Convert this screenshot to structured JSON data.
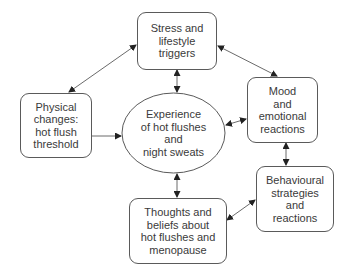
{
  "diagram": {
    "type": "cycle-model",
    "colors": {
      "stroke": "#5a5a5a",
      "text": "#3a3a3a",
      "background": "#ffffff",
      "arrow": "#222222"
    },
    "center": {
      "id": "experience",
      "label": "Experience\nof hot flushes\nand\nnight sweats",
      "shape": "ellipse"
    },
    "nodes": [
      {
        "id": "stress",
        "label": "Stress and\nlifestyle\ntriggers",
        "shape": "rounded-rect"
      },
      {
        "id": "physical",
        "label": "Physical\nchanges:\nhot flush\nthreshold",
        "shape": "rounded-rect"
      },
      {
        "id": "mood",
        "label": "Mood\nand\nemotional\nreactions",
        "shape": "rounded-rect"
      },
      {
        "id": "behavioural",
        "label": "Behavioural\nstrategies\nand\nreactions",
        "shape": "rounded-rect"
      },
      {
        "id": "thoughts",
        "label": "Thoughts and\nbeliefs about\nhot flushes and\nmenopause",
        "shape": "rounded-rect"
      }
    ],
    "edges": [
      {
        "from": "stress",
        "to": "physical",
        "direction": "both"
      },
      {
        "from": "stress",
        "to": "mood",
        "direction": "both"
      },
      {
        "from": "stress",
        "to": "experience",
        "direction": "both"
      },
      {
        "from": "physical",
        "to": "experience",
        "direction": "forward"
      },
      {
        "from": "mood",
        "to": "experience",
        "direction": "both"
      },
      {
        "from": "mood",
        "to": "behavioural",
        "direction": "both"
      },
      {
        "from": "experience",
        "to": "thoughts",
        "direction": "both"
      },
      {
        "from": "behavioural",
        "to": "thoughts",
        "direction": "both"
      }
    ]
  }
}
